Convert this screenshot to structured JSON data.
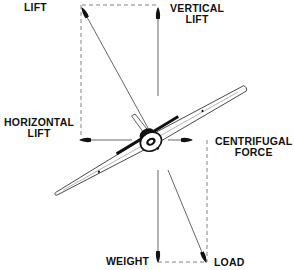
{
  "diagram": {
    "type": "force-vector-diagram",
    "colors": {
      "ink": "#111111",
      "line": "#555555",
      "dashed": "#777777",
      "background": "#ffffff"
    },
    "labels": {
      "lift": "LIFT",
      "vertical_lift": {
        "line1": "VERTICAL",
        "line2": "LIFT"
      },
      "horizontal_lift": {
        "line1": "HORIZONTAL",
        "line2": "LIFT"
      },
      "centrifugal_force": {
        "line1": "CENTRIFUGAL",
        "line2": "FORCE"
      },
      "weight": "WEIGHT",
      "load": "LOAD"
    },
    "vectors": [
      {
        "name": "lift",
        "from": [
          148,
          128
        ],
        "to": [
          82,
          8
        ]
      },
      {
        "name": "vertical-lift",
        "from": [
          158,
          96
        ],
        "to": [
          158,
          8
        ]
      },
      {
        "name": "horizontal-lift",
        "from": [
          132,
          140
        ],
        "to": [
          80,
          140
        ]
      },
      {
        "name": "centrifugal-force",
        "from": [
          168,
          140
        ],
        "to": [
          192,
          140
        ]
      },
      {
        "name": "weight",
        "from": [
          158,
          170
        ],
        "to": [
          158,
          262
        ]
      },
      {
        "name": "load",
        "from": [
          168,
          170
        ],
        "to": [
          206,
          262
        ]
      }
    ],
    "dashed_lines": [
      {
        "name": "top",
        "from": [
          82,
          5
        ],
        "to": [
          158,
          5
        ]
      },
      {
        "name": "left",
        "from": [
          81,
          5
        ],
        "to": [
          81,
          136
        ]
      },
      {
        "name": "right",
        "from": [
          207,
          140
        ],
        "to": [
          207,
          262
        ]
      },
      {
        "name": "bottom",
        "from": [
          158,
          262
        ],
        "to": [
          207,
          262
        ]
      }
    ]
  }
}
